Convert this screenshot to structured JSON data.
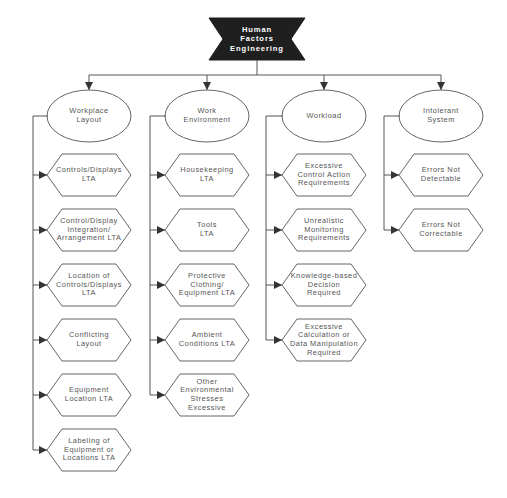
{
  "diagram": {
    "root": {
      "label": "Human\nFactors\nEngineering",
      "cx": 257,
      "cy": 38
    },
    "colors": {
      "root_fill": "#1f1f1f",
      "line": "#555555",
      "text": "#555555",
      "root_text": "#ffffff"
    },
    "categories": [
      {
        "label": "Workplace\nLayout",
        "cx": 89,
        "rail_x": 33,
        "items": [
          {
            "label": "Controls/Displays\nLTA",
            "cy": 175
          },
          {
            "label": "Control/Display\nIntegration/\nArrangement  LTA",
            "cy": 230
          },
          {
            "label": "Location of\nControls/Displays\nLTA",
            "cy": 285
          },
          {
            "label": "Conflicting\nLayout",
            "cy": 340
          },
          {
            "label": "Equipment\nLocation  LTA",
            "cy": 395
          },
          {
            "label": "Labeling of\nEquipment or\nLocations  LTA",
            "cy": 450
          }
        ]
      },
      {
        "label": "Work\nEnvironment",
        "cx": 207,
        "rail_x": 150,
        "items": [
          {
            "label": "Housekeeping\nLTA",
            "cy": 175
          },
          {
            "label": "Tools\nLTA",
            "cy": 230
          },
          {
            "label": "Protective\nClothing/\nEquipment  LTA",
            "cy": 285
          },
          {
            "label": "Ambient\nConditions  LTA",
            "cy": 340
          },
          {
            "label": "Other\nEnvironmental\nStresses\nExcessive",
            "cy": 395
          }
        ]
      },
      {
        "label": "Workload",
        "cx": 324,
        "rail_x": 266,
        "items": [
          {
            "label": "Excessive\nControl Action\nRequirements",
            "cy": 175
          },
          {
            "label": "Unrealistic\nMonitoring\nRequirements",
            "cy": 230
          },
          {
            "label": "Knowledge-based\nDecision\nRequired",
            "cy": 285
          },
          {
            "label": "Excessive\nCalculation or\nData Manipulation\nRequired",
            "cy": 340
          }
        ]
      },
      {
        "label": "Intolerant\nSystem",
        "cx": 441,
        "rail_x": 384,
        "items": [
          {
            "label": "Errors Not\nDetectable",
            "cy": 175
          },
          {
            "label": "Errors Not\nCorrectable",
            "cy": 230
          }
        ]
      }
    ]
  }
}
